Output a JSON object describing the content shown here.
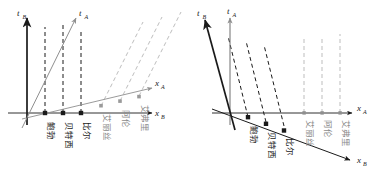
{
  "figure": {
    "title": "",
    "panels": [
      {
        "id": "left-panel",
        "axes": {
          "tB": {
            "label": "t",
            "sub": "B"
          },
          "tA": {
            "label": "t",
            "sub": "A"
          },
          "xA": {
            "label": "x",
            "sub": "A"
          },
          "xB": {
            "label": "x",
            "sub": "B"
          }
        },
        "black_events": [
          {
            "name": "鲍勃",
            "x": 45
          },
          {
            "name": "贝特西",
            "x": 63
          },
          {
            "name": "比尔",
            "x": 81
          }
        ],
        "grey_events": [
          {
            "name": "艾丽丝",
            "x": 101
          },
          {
            "name": "阿伦",
            "x": 120
          },
          {
            "name": "艾弗里",
            "x": 139
          }
        ]
      },
      {
        "id": "right-panel",
        "axes": {
          "tB": {
            "label": "t",
            "sub": "B"
          },
          "tA": {
            "label": "t",
            "sub": "A"
          },
          "xA": {
            "label": "x",
            "sub": "A"
          },
          "xB": {
            "label": "x",
            "sub": "B"
          }
        },
        "black_events": [
          {
            "name": "鲍勃",
            "x": 248
          },
          {
            "name": "贝特西",
            "x": 266
          },
          {
            "name": "比尔",
            "x": 284
          }
        ],
        "grey_events": [
          {
            "name": "艾丽丝",
            "x": 304
          },
          {
            "name": "阿伦",
            "x": 322
          },
          {
            "name": "艾弗里",
            "x": 340
          }
        ]
      }
    ],
    "colors": {
      "axis": "#1a1a1a",
      "grey": "#9a9a9a",
      "dash_black": "#1a1a1a",
      "dash_grey": "#b0b0b0",
      "background": "#ffffff"
    }
  }
}
